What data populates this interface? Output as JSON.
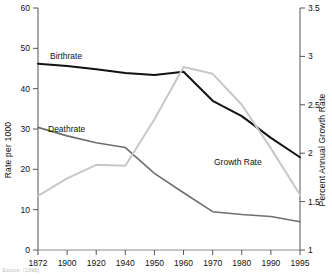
{
  "figure": {
    "background": "#ffffff",
    "source_note": "Source: (1998)"
  },
  "chart_data": {
    "type": "line",
    "title": "",
    "xlabel": "",
    "ylabel": "Rate per 1000",
    "y2label": "Percent Annual Growth Rate",
    "categories": [
      "1872",
      "1900",
      "1920",
      "1940",
      "1950",
      "1960",
      "1970",
      "1980",
      "1990",
      "1995"
    ],
    "x_tick_labels": [
      "1872",
      "1900",
      "1920",
      "1940",
      "1950",
      "1960",
      "1970",
      "1980",
      "1990",
      "1995"
    ],
    "ylim": [
      0,
      60
    ],
    "y_ticks": [
      0,
      10,
      20,
      30,
      40,
      50,
      60
    ],
    "y_tick_labels": [
      "0",
      "10",
      "20",
      "30",
      "40",
      "50",
      "60"
    ],
    "y2lim": [
      1,
      3.5
    ],
    "y2_ticks": [
      1,
      1.5,
      2,
      2.5,
      3,
      3.5
    ],
    "y2_tick_labels": [
      "1",
      "1.5",
      "2",
      "2.5",
      "3",
      "3.5"
    ],
    "grid": false,
    "legend": "inline-annotations",
    "series": [
      {
        "name": "Birthrate",
        "axis": "left",
        "color": "#121212",
        "width": 2.0,
        "values": [
          46.2,
          45.6,
          44.8,
          43.9,
          43.4,
          44.2,
          37.0,
          33.2,
          27.8,
          23.0
        ]
      },
      {
        "name": "Deathrate",
        "axis": "left",
        "color": "#6e6e6e",
        "width": 1.6,
        "values": [
          30.4,
          28.3,
          26.6,
          25.4,
          19.0,
          14.2,
          9.5,
          8.8,
          8.3,
          7.0
        ]
      },
      {
        "name": "Growth Rate",
        "axis": "right",
        "color": "#c7c7c7",
        "width": 2.0,
        "values": [
          1.56,
          1.74,
          1.88,
          1.87,
          2.35,
          2.89,
          2.82,
          2.5,
          2.05,
          1.57
        ]
      }
    ],
    "annotations": [
      {
        "text": "Birthrate",
        "x_px": 50,
        "y_px": 59
      },
      {
        "text": "Deathrate",
        "x_px": 48,
        "y_px": 132
      },
      {
        "text": "Growth Rate",
        "x_px": 214,
        "y_px": 165
      }
    ]
  }
}
